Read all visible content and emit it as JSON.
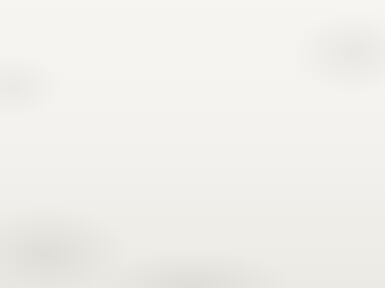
{
  "document": {
    "kind": "crochet-stitch-chart",
    "description": "Trapezoidal crochet pattern chart built from rows of V-stitch symbols, read bottom to top",
    "background_color": "#f2f1ed",
    "ink_color": "#3a3a3a"
  },
  "chart_data": {
    "type": "diagram",
    "title": "",
    "xlabel": "",
    "ylabel": "",
    "symbol": "V-stitch",
    "total_rows": 20,
    "read_direction": "bottom-to-top",
    "shape": "trapezoid",
    "geometry": {
      "top_row_left_x": 42,
      "top_row_right_x": 307,
      "bottom_row_left_x": 8,
      "bottom_row_right_x": 343,
      "top_y": 12,
      "bottom_y": 276,
      "row_height": 13.2
    },
    "rows": [
      {
        "row": 1,
        "y": 270,
        "left_x": 8,
        "right_x": 343,
        "stitches": 24
      },
      {
        "row": 2,
        "y": 257,
        "left_x": 9,
        "right_x": 343,
        "stitches": 24
      },
      {
        "row": 3,
        "y": 244,
        "left_x": 10,
        "right_x": 343,
        "stitches": 24
      },
      {
        "row": 4,
        "y": 231,
        "left_x": 11,
        "right_x": 343,
        "stitches": 24
      },
      {
        "row": 5,
        "y": 218,
        "left_x": 12,
        "right_x": 343,
        "stitches": 24
      },
      {
        "row": 6,
        "y": 205,
        "left_x": 13,
        "right_x": 342,
        "stitches": 24
      },
      {
        "row": 7,
        "y": 192,
        "left_x": 14,
        "right_x": 342,
        "stitches": 24
      },
      {
        "row": 8,
        "y": 179,
        "left_x": 15,
        "right_x": 342,
        "stitches": 24
      },
      {
        "row": 9,
        "y": 166,
        "left_x": 16,
        "right_x": 341,
        "stitches": 24
      },
      {
        "row": 10,
        "y": 153,
        "left_x": 18,
        "right_x": 340,
        "stitches": 23
      },
      {
        "row": 11,
        "y": 140,
        "left_x": 21,
        "right_x": 337,
        "stitches": 23
      },
      {
        "row": 12,
        "y": 127,
        "left_x": 24,
        "right_x": 334,
        "stitches": 23
      },
      {
        "row": 13,
        "y": 114,
        "left_x": 26,
        "right_x": 331,
        "stitches": 23
      },
      {
        "row": 14,
        "y": 101,
        "left_x": 29,
        "right_x": 327,
        "stitches": 23
      },
      {
        "row": 15,
        "y": 88,
        "left_x": 31,
        "right_x": 324,
        "stitches": 23
      },
      {
        "row": 16,
        "y": 75,
        "left_x": 33,
        "right_x": 320,
        "stitches": 23
      },
      {
        "row": 17,
        "y": 62,
        "left_x": 36,
        "right_x": 316,
        "stitches": 23
      },
      {
        "row": 18,
        "y": 49,
        "left_x": 38,
        "right_x": 313,
        "stitches": 23
      },
      {
        "row": 19,
        "y": 36,
        "left_x": 40,
        "right_x": 310,
        "stitches": 23
      },
      {
        "row": 20,
        "y": 23,
        "left_x": 42,
        "right_x": 307,
        "stitches": 23
      }
    ]
  },
  "markers": [
    {
      "label": "20",
      "row": 20,
      "y": 26,
      "arrow_x": 318,
      "icon": "arrow-right-icon"
    },
    {
      "label": "15",
      "row": 15,
      "y": 90,
      "arrow_x": 326,
      "icon": "arrow-right-icon"
    },
    {
      "label": "10",
      "row": 10,
      "y": 158,
      "arrow_x": 341,
      "icon": "arrow-right-icon"
    },
    {
      "label": "5",
      "row": 5,
      "y": 224,
      "arrow_x": 344,
      "icon": "arrow-right-icon"
    },
    {
      "label": "1",
      "row": 1,
      "y": 270,
      "arrow_x": 344,
      "icon": "arrow-right-icon"
    }
  ]
}
